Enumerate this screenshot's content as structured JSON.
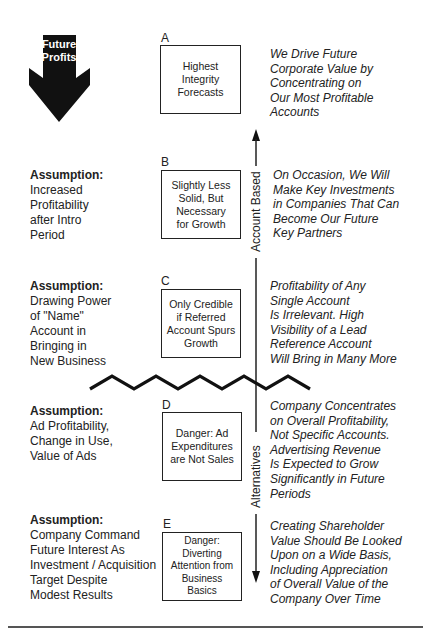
{
  "arrow": {
    "label_lines": [
      "Future",
      "Profits"
    ],
    "color": "#111111"
  },
  "axis": {
    "top_label": "Account Based",
    "bottom_label": "Alternatives"
  },
  "levels": [
    {
      "letter": "A",
      "box_lines": [
        "Highest",
        "Integrity",
        "Forecasts"
      ],
      "assumption": null,
      "description_lines": [
        "We Drive Future",
        "Corporate Value by",
        "Concentrating on",
        "Our Most Profitable",
        "Accounts"
      ]
    },
    {
      "letter": "B",
      "box_lines": [
        "Slightly Less",
        "Solid, But",
        "Necessary",
        "for Growth"
      ],
      "assumption": {
        "title": "Assumption:",
        "lines": [
          "Increased",
          "Profitability",
          "after Intro",
          "Period"
        ]
      },
      "description_lines": [
        "On Occasion, We Will",
        "Make Key Investments",
        "in Companies That Can",
        "Become Our Future",
        "Key Partners"
      ]
    },
    {
      "letter": "C",
      "box_lines": [
        "Only Credible",
        "if Referred",
        "Account Spurs",
        "Growth"
      ],
      "assumption": {
        "title": "Assumption:",
        "lines": [
          "Drawing Power",
          "of \"Name\"",
          "Account in",
          "Bringing in",
          "New Business"
        ]
      },
      "description_lines": [
        "Profitability of Any",
        "Single Account",
        "Is Irrelevant. High",
        "Visibility of a Lead",
        "Reference Account",
        "Will Bring in Many More"
      ]
    },
    {
      "letter": "D",
      "box_lines": [
        "Danger: Ad",
        "Expenditures",
        "are Not Sales"
      ],
      "assumption": {
        "title": "Assumption:",
        "lines": [
          "Ad Profitability,",
          "Change in Use,",
          "Value of Ads"
        ]
      },
      "description_lines": [
        "Company Concentrates",
        "on Overall Profitability,",
        "Not Specific Accounts.",
        "Advertising Revenue",
        "Is Expected to Grow",
        "Significantly in Future",
        "Periods"
      ]
    },
    {
      "letter": "E",
      "box_lines": [
        "Danger:",
        "Diverting",
        "Attention from",
        "Business",
        "Basics"
      ],
      "assumption": {
        "title": "Assumption:",
        "lines": [
          "Company Command",
          "Future Interest As",
          "Investment / Acquisition",
          "Target Despite",
          "Modest Results"
        ]
      },
      "description_lines": [
        "Creating Shareholder",
        "Value Should Be Looked",
        "Upon on a Wide Basis,",
        "Including Appreciation",
        "of Overall Value of the",
        "Company Over Time"
      ]
    }
  ]
}
